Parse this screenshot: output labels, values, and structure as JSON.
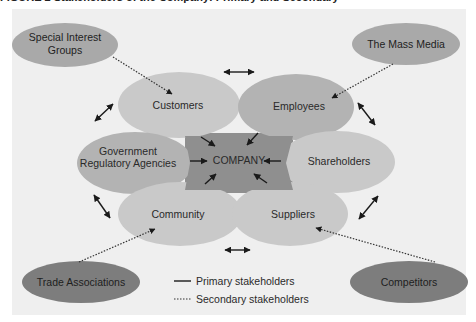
{
  "caption": "FIGURE 2 Stakeholders of the Company: Primary and Secondary",
  "diagram": {
    "center": {
      "label": "COMPANY",
      "color": "#8f8f8f"
    },
    "primary_stakeholders": [
      {
        "id": "customers",
        "label": "Customers"
      },
      {
        "id": "employees",
        "label": "Employees"
      },
      {
        "id": "government",
        "label_line1": "Government",
        "label_line2": "Regulatory Agencies"
      },
      {
        "id": "shareholders",
        "label": "Shareholders"
      },
      {
        "id": "community",
        "label": "Community"
      },
      {
        "id": "suppliers",
        "label": "Suppliers"
      }
    ],
    "secondary_stakeholders": [
      {
        "id": "special-interest",
        "label_line1": "Special Interest",
        "label_line2": "Groups"
      },
      {
        "id": "mass-media",
        "label": "The Mass Media"
      },
      {
        "id": "trade-associations",
        "label": "Trade Associations"
      },
      {
        "id": "competitors",
        "label": "Competitors"
      }
    ],
    "legend": {
      "primary": "Primary stakeholders",
      "secondary": "Secondary stakeholders"
    },
    "colors": {
      "background": "#efefef",
      "primary_light": "#c9c9c9",
      "primary_mid": "#b3b3b3",
      "secondary_light": "#a9a9a9",
      "secondary_dark": "#7d7d7d",
      "company": "#8f8f8f"
    }
  }
}
